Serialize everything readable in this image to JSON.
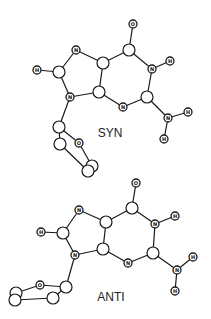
{
  "figure": {
    "conformers": [
      {
        "id": "syn",
        "caption": "SYN",
        "caption_pos": [
          110,
          133
        ],
        "atoms": [
          {
            "id": "O6",
            "label": "O",
            "x": 133,
            "y": 24,
            "size": "small"
          },
          {
            "id": "C6",
            "label": "",
            "x": 129,
            "y": 50,
            "size": "big"
          },
          {
            "id": "N1",
            "label": "N",
            "x": 152,
            "y": 69,
            "size": "small"
          },
          {
            "id": "H1",
            "label": "H",
            "x": 170,
            "y": 61,
            "size": "small"
          },
          {
            "id": "C2",
            "label": "",
            "x": 147,
            "y": 97,
            "size": "big"
          },
          {
            "id": "N3",
            "label": "N",
            "x": 123,
            "y": 107,
            "size": "small"
          },
          {
            "id": "C4",
            "label": "",
            "x": 99,
            "y": 92,
            "size": "big"
          },
          {
            "id": "C5",
            "label": "",
            "x": 103,
            "y": 63,
            "size": "big"
          },
          {
            "id": "N7",
            "label": "N",
            "x": 76,
            "y": 50,
            "size": "small"
          },
          {
            "id": "C8",
            "label": "",
            "x": 59,
            "y": 72,
            "size": "big"
          },
          {
            "id": "H8",
            "label": "H",
            "x": 37,
            "y": 70,
            "size": "small"
          },
          {
            "id": "N9",
            "label": "N",
            "x": 70,
            "y": 97,
            "size": "small"
          },
          {
            "id": "N2",
            "label": "N",
            "x": 168,
            "y": 118,
            "size": "small"
          },
          {
            "id": "H2a",
            "label": "H",
            "x": 188,
            "y": 112,
            "size": "small"
          },
          {
            "id": "H2b",
            "label": "H",
            "x": 164,
            "y": 139,
            "size": "small"
          },
          {
            "id": "S1",
            "label": "",
            "x": 59,
            "y": 127,
            "size": "big"
          },
          {
            "id": "SO",
            "label": "O",
            "x": 79,
            "y": 143,
            "size": "small"
          },
          {
            "id": "S2",
            "label": "",
            "x": 60,
            "y": 144,
            "size": "big"
          },
          {
            "id": "S4",
            "label": "",
            "x": 92,
            "y": 166,
            "size": "big"
          },
          {
            "id": "S3",
            "label": "",
            "x": 88,
            "y": 171,
            "size": "big"
          }
        ],
        "bonds": [
          [
            "O6",
            "C6"
          ],
          [
            "C6",
            "N1"
          ],
          [
            "N1",
            "H1"
          ],
          [
            "N1",
            "C2"
          ],
          [
            "C2",
            "N3"
          ],
          [
            "N3",
            "C4"
          ],
          [
            "C4",
            "C5"
          ],
          [
            "C5",
            "C6"
          ],
          [
            "C5",
            "N7"
          ],
          [
            "N7",
            "C8"
          ],
          [
            "C8",
            "H8"
          ],
          [
            "C8",
            "N9"
          ],
          [
            "N9",
            "C4"
          ],
          [
            "C2",
            "N2"
          ],
          [
            "N2",
            "H2a"
          ],
          [
            "N2",
            "H2b"
          ],
          [
            "N9",
            "S1"
          ],
          [
            "S1",
            "SO"
          ],
          [
            "S1",
            "S2"
          ],
          [
            "SO",
            "S4"
          ],
          [
            "S2",
            "S3"
          ]
        ]
      },
      {
        "id": "anti",
        "caption": "ANTI",
        "caption_pos": [
          111,
          297
        ],
        "atoms": [
          {
            "id": "O6",
            "label": "O",
            "x": 136,
            "y": 183,
            "size": "small"
          },
          {
            "id": "C6",
            "label": "",
            "x": 132,
            "y": 208,
            "size": "big"
          },
          {
            "id": "N1",
            "label": "N",
            "x": 155,
            "y": 224,
            "size": "small"
          },
          {
            "id": "H1",
            "label": "H",
            "x": 175,
            "y": 216,
            "size": "small"
          },
          {
            "id": "C2",
            "label": "",
            "x": 153,
            "y": 253,
            "size": "big"
          },
          {
            "id": "N3",
            "label": "N",
            "x": 128,
            "y": 263,
            "size": "small"
          },
          {
            "id": "C4",
            "label": "",
            "x": 103,
            "y": 249,
            "size": "big"
          },
          {
            "id": "C5",
            "label": "",
            "x": 106,
            "y": 222,
            "size": "big"
          },
          {
            "id": "N7",
            "label": "N",
            "x": 79,
            "y": 210,
            "size": "small"
          },
          {
            "id": "C8",
            "label": "",
            "x": 63,
            "y": 233,
            "size": "big"
          },
          {
            "id": "H8",
            "label": "H",
            "x": 41,
            "y": 232,
            "size": "small"
          },
          {
            "id": "N9",
            "label": "N",
            "x": 75,
            "y": 255,
            "size": "small"
          },
          {
            "id": "N2",
            "label": "N",
            "x": 177,
            "y": 270,
            "size": "small"
          },
          {
            "id": "H2a",
            "label": "H",
            "x": 193,
            "y": 257,
            "size": "small"
          },
          {
            "id": "H2b",
            "label": "H",
            "x": 175,
            "y": 291,
            "size": "small"
          },
          {
            "id": "S1",
            "label": "",
            "x": 66,
            "y": 287,
            "size": "big"
          },
          {
            "id": "SO",
            "label": "O",
            "x": 40,
            "y": 285,
            "size": "small"
          },
          {
            "id": "S4",
            "label": "",
            "x": 16,
            "y": 293,
            "size": "big"
          },
          {
            "id": "S3",
            "label": "",
            "x": 15,
            "y": 300,
            "size": "big"
          },
          {
            "id": "S2",
            "label": "",
            "x": 53,
            "y": 298,
            "size": "big"
          }
        ],
        "bonds": [
          [
            "O6",
            "C6"
          ],
          [
            "C6",
            "N1"
          ],
          [
            "N1",
            "H1"
          ],
          [
            "N1",
            "C2"
          ],
          [
            "C2",
            "N3"
          ],
          [
            "N3",
            "C4"
          ],
          [
            "C4",
            "C5"
          ],
          [
            "C5",
            "C6"
          ],
          [
            "C5",
            "N7"
          ],
          [
            "N7",
            "C8"
          ],
          [
            "C8",
            "H8"
          ],
          [
            "C8",
            "N9"
          ],
          [
            "N9",
            "C4"
          ],
          [
            "C2",
            "N2"
          ],
          [
            "N2",
            "H2a"
          ],
          [
            "N2",
            "H2b"
          ],
          [
            "N9",
            "S1"
          ],
          [
            "S1",
            "SO"
          ],
          [
            "SO",
            "S4"
          ],
          [
            "S1",
            "S2"
          ],
          [
            "S2",
            "S3"
          ],
          [
            "S4",
            "S3"
          ]
        ]
      }
    ],
    "style": {
      "line_color": "#1a1a1a",
      "background": "#ffffff",
      "big_radius": 6,
      "small_radius": 4
    }
  }
}
